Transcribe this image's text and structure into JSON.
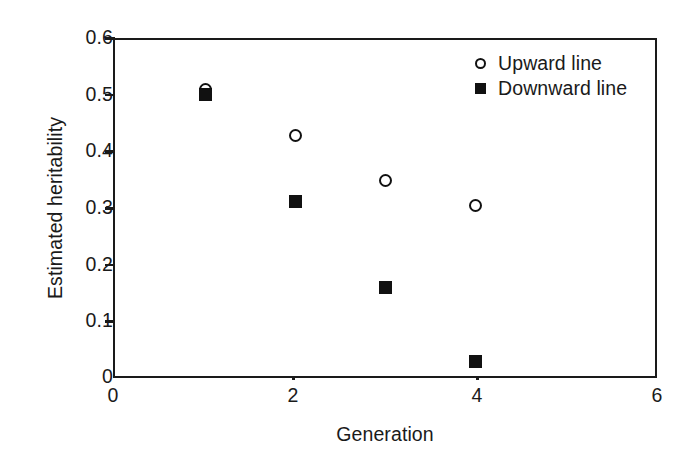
{
  "chart_data": {
    "type": "scatter",
    "title": "",
    "xlabel": "Generation",
    "ylabel": "Estimated heritability",
    "xlim": [
      0,
      6
    ],
    "ylim": [
      0,
      0.6
    ],
    "grid": false,
    "legend_position": "top-right",
    "x_ticks": [
      "0",
      "2",
      "4",
      "6"
    ],
    "x_tick_values": [
      0,
      2,
      4,
      6
    ],
    "y_ticks": [
      "0",
      "0.1",
      "0.2",
      "0.3",
      "0.4",
      "0.5",
      "0.6"
    ],
    "y_tick_values": [
      0,
      0.1,
      0.2,
      0.3,
      0.4,
      0.5,
      0.6
    ],
    "series": [
      {
        "name": "Upward line",
        "marker": "open-circle",
        "color": "#111111",
        "x": [
          1,
          2,
          3,
          4
        ],
        "values": [
          0.512,
          0.43,
          0.35,
          0.305
        ]
      },
      {
        "name": "Downward line",
        "marker": "filled-square",
        "color": "#111111",
        "x": [
          1,
          2,
          3,
          4
        ],
        "values": [
          0.503,
          0.312,
          0.158,
          0.026
        ]
      }
    ]
  },
  "legend": {
    "items": [
      {
        "label": "Upward line",
        "marker": "open-circle"
      },
      {
        "label": "Downward line",
        "marker": "filled-square"
      }
    ]
  },
  "axis_color": "#1a1a1a"
}
